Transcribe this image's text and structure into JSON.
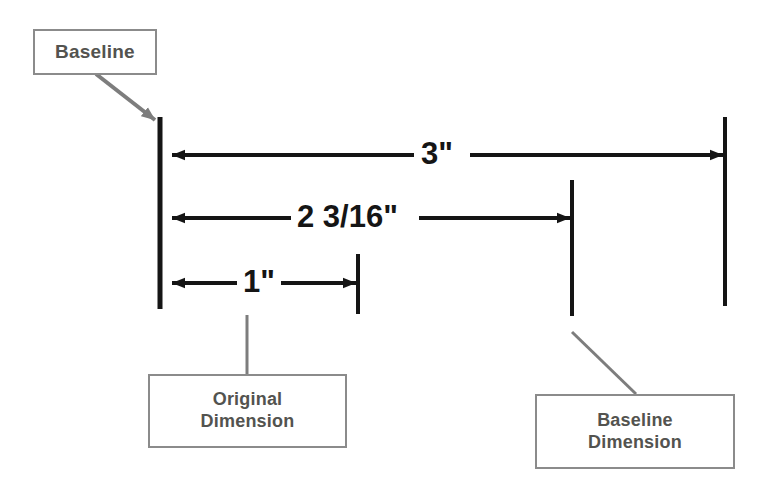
{
  "diagram": {
    "background_color": "#ffffff",
    "line_color": "#151515",
    "callout_border_color": "#8b8b8b",
    "callout_text_color": "#53534f",
    "leader_color": "#7d7d7d"
  },
  "callouts": {
    "baseline": {
      "label": "Baseline"
    },
    "original_dimension": {
      "line1": "Original",
      "line2": "Dimension"
    },
    "baseline_dimension": {
      "line1": "Baseline",
      "line2": "Dimension"
    }
  },
  "dimensions": [
    {
      "id": "overall",
      "label": "3\"",
      "value_inches": 3,
      "arrow_style": "double",
      "row_y": 155
    },
    {
      "id": "intermediate",
      "label": "2 3/16\"",
      "value_inches": 2.1875,
      "arrow_style": "double",
      "row_y": 218
    },
    {
      "id": "first",
      "label": "1\"",
      "value_inches": 1,
      "arrow_style": "double",
      "row_y": 283
    }
  ],
  "extension_lines": [
    {
      "id": "baseline-edge",
      "x": 160,
      "y_top": 117,
      "y_bottom": 309
    },
    {
      "id": "first-feature",
      "x": 358,
      "y_top": 254,
      "y_bottom": 314
    },
    {
      "id": "second-feature",
      "x": 572,
      "y_top": 180,
      "y_bottom": 316
    },
    {
      "id": "third-feature",
      "x": 725,
      "y_top": 117,
      "y_bottom": 306
    }
  ]
}
